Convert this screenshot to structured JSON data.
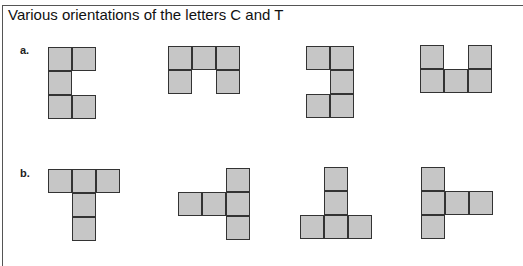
{
  "figure": {
    "title": "Various orientations of the letters C and T",
    "cell_color": "#c6c6c6",
    "stroke_color": "#333333"
  },
  "rows": [
    {
      "label": "a.",
      "letter": "C",
      "shapes": [
        {
          "x": 48,
          "y": 47,
          "cells": [
            [
              0,
              0
            ],
            [
              1,
              0
            ],
            [
              0,
              1
            ],
            [
              0,
              2
            ],
            [
              1,
              2
            ]
          ]
        },
        {
          "x": 168,
          "y": 46,
          "cells": [
            [
              0,
              0
            ],
            [
              1,
              0
            ],
            [
              2,
              0
            ],
            [
              0,
              1
            ],
            [
              2,
              1
            ]
          ]
        },
        {
          "x": 306,
          "y": 46,
          "cells": [
            [
              0,
              0
            ],
            [
              1,
              0
            ],
            [
              1,
              1
            ],
            [
              0,
              2
            ],
            [
              1,
              2
            ]
          ]
        },
        {
          "x": 420,
          "y": 45,
          "cells": [
            [
              0,
              0
            ],
            [
              2,
              0
            ],
            [
              0,
              1
            ],
            [
              1,
              1
            ],
            [
              2,
              1
            ]
          ]
        }
      ]
    },
    {
      "label": "b.",
      "letter": "T",
      "shapes": [
        {
          "x": 48,
          "y": 169,
          "cells": [
            [
              0,
              0
            ],
            [
              1,
              0
            ],
            [
              2,
              0
            ],
            [
              1,
              1
            ],
            [
              1,
              2
            ]
          ]
        },
        {
          "x": 178,
          "y": 168,
          "cells": [
            [
              2,
              0
            ],
            [
              0,
              1
            ],
            [
              1,
              1
            ],
            [
              2,
              1
            ],
            [
              2,
              2
            ]
          ]
        },
        {
          "x": 300,
          "y": 167,
          "cells": [
            [
              1,
              0
            ],
            [
              1,
              1
            ],
            [
              0,
              2
            ],
            [
              1,
              2
            ],
            [
              2,
              2
            ]
          ]
        },
        {
          "x": 421,
          "y": 167,
          "cells": [
            [
              0,
              0
            ],
            [
              0,
              1
            ],
            [
              1,
              1
            ],
            [
              2,
              1
            ],
            [
              0,
              2
            ]
          ]
        }
      ]
    }
  ]
}
